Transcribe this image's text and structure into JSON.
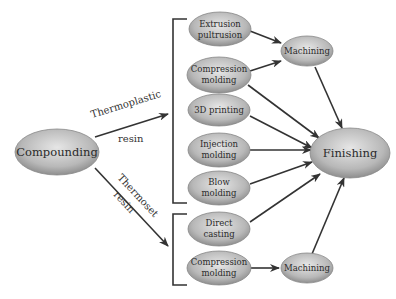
{
  "diagram": {
    "type": "process-flow",
    "nodes": {
      "compounding": "Compounding",
      "extrusion": [
        "Extrusion",
        "pultrusion"
      ],
      "compression_tp": [
        "Compression",
        "molding"
      ],
      "printing": "3D printing",
      "injection": [
        "Injection",
        "molding"
      ],
      "blow": [
        "Blow",
        "molding"
      ],
      "direct": [
        "Direct",
        "casting"
      ],
      "compression_ts": [
        "Compression",
        "molding"
      ],
      "machining_top": "Machining",
      "machining_bottom": "Machining",
      "finishing": "Finishing"
    },
    "edge_labels": {
      "thermoplastic_1": "Thermoplastic",
      "thermoplastic_2": "resin",
      "thermoset_1": "Thermoset",
      "thermoset_2": "resin"
    },
    "colors": {
      "node_fill_light": "#e4e4e4",
      "node_fill_dark": "#9a9a9a",
      "stroke": "#333333"
    }
  }
}
